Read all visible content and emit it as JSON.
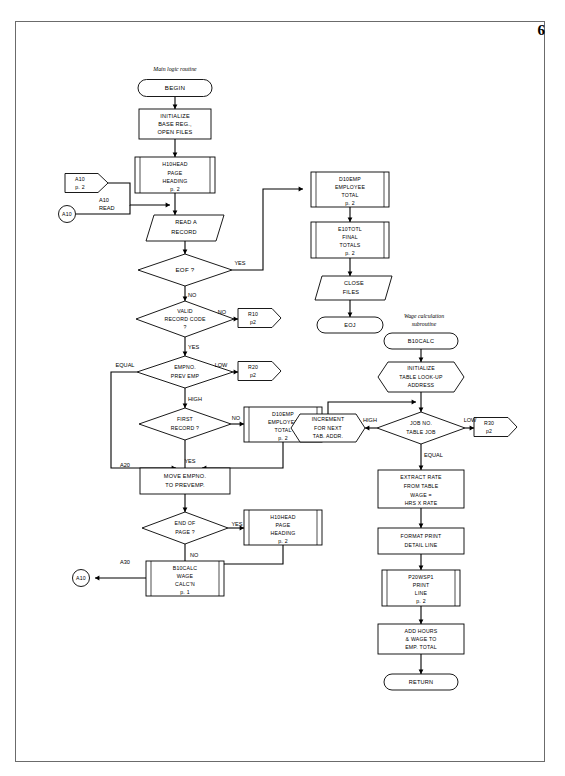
{
  "page": {
    "number": "6",
    "captions": {
      "main_routine": "Main logic routine",
      "wage_subroutine": "Wage calculation subroutine"
    }
  },
  "flowchart": {
    "title": "COBOL payroll program flowchart",
    "nodes": [
      {
        "id": "begin",
        "type": "terminator",
        "label": "BEGIN",
        "lines": [
          "BEGIN"
        ],
        "x": 175,
        "y": 88,
        "w": 74,
        "h": 17
      },
      {
        "id": "init",
        "type": "process",
        "label": "INITIALIZE BASE REG., OPEN FILES",
        "lines": [
          "INITIALIZE",
          "BASE REG.,",
          "OPEN FILES"
        ],
        "x": 175,
        "y": 124,
        "w": 72,
        "h": 30
      },
      {
        "id": "h10head1",
        "type": "predefined-process",
        "label": "H10HEAD PAGE HEADING p. 2",
        "lines": [
          "H10HEAD",
          "PAGE",
          "HEADING",
          "p. 2"
        ],
        "x": 175,
        "y": 175,
        "w": 80,
        "h": 36
      },
      {
        "id": "conn_a10_offpage",
        "type": "offpage-connector",
        "label": "A10 p. 2",
        "lines": [
          "A10",
          "p. 2"
        ],
        "x": 86,
        "y": 183,
        "w": 42,
        "h": 19
      },
      {
        "id": "conn_a10_circle",
        "type": "connector-circle",
        "label": "A10",
        "lines": [
          "A10"
        ],
        "x": 67,
        "y": 214,
        "w": 17,
        "h": 17
      },
      {
        "id": "read",
        "type": "input-output",
        "label": "READ A RECORD",
        "lines": [
          "READ A",
          "RECORD"
        ],
        "x": 185,
        "y": 228,
        "w": 78,
        "h": 26
      },
      {
        "id": "eof",
        "type": "decision",
        "label": "EOF ?",
        "lines": [
          "EOF ?"
        ],
        "x": 185,
        "y": 270,
        "w": 94,
        "h": 32
      },
      {
        "id": "validcode",
        "type": "decision",
        "label": "VALID RECORD CODE ?",
        "lines": [
          "VALID",
          "RECORD CODE",
          "?"
        ],
        "x": 185,
        "y": 319,
        "w": 98,
        "h": 36
      },
      {
        "id": "conn_r10",
        "type": "offpage-connector",
        "label": "R10 p2",
        "lines": [
          "R10",
          "p2"
        ],
        "x": 243,
        "y": 318,
        "w": 38,
        "h": 19
      },
      {
        "id": "empno",
        "type": "decision",
        "label": "EMPNO. PREV EMP",
        "lines": [
          "EMPNO.",
          "PREV EMP"
        ],
        "x": 185,
        "y": 372,
        "w": 96,
        "h": 32
      },
      {
        "id": "conn_r20",
        "type": "offpage-connector",
        "label": "R20 p2",
        "lines": [
          "R20",
          "p2"
        ],
        "x": 243,
        "y": 371,
        "w": 38,
        "h": 19
      },
      {
        "id": "firstrec",
        "type": "decision",
        "label": "FIRST RECORD ?",
        "lines": [
          "FIRST",
          "RECORD ?"
        ],
        "x": 185,
        "y": 424,
        "w": 92,
        "h": 32
      },
      {
        "id": "d10emp_a",
        "type": "predefined-process",
        "label": "D10EMP EMPLOYEE TOTAL p. 2",
        "lines": [
          "D10EMP",
          "EMPLOYEE",
          "TOTAL",
          "p. 2"
        ],
        "x": 283,
        "y": 424,
        "w": 78,
        "h": 35
      },
      {
        "id": "move",
        "type": "process",
        "label": "MOVE EMPNO. TO PREVEMP.",
        "lines": [
          "MOVE EMPNO.",
          "TO PREVEMP."
        ],
        "x": 185,
        "y": 481,
        "w": 90,
        "h": 26
      },
      {
        "id": "endpage",
        "type": "decision",
        "label": "END OF PAGE ?",
        "lines": [
          "END OF",
          "PAGE ?"
        ],
        "x": 185,
        "y": 528,
        "w": 86,
        "h": 32
      },
      {
        "id": "h10head2",
        "type": "predefined-process",
        "label": "H10HEAD PAGE HEADING p. 2",
        "lines": [
          "H10HEAD",
          "PAGE",
          "HEADING",
          "p. 2"
        ],
        "x": 283,
        "y": 527,
        "w": 78,
        "h": 35
      },
      {
        "id": "b10calc_call",
        "type": "predefined-process",
        "label": "B10CALC WAGE CALC'N p. 1",
        "lines": [
          "B10CALC",
          "WAGE",
          "CALC'N",
          "p. 1"
        ],
        "x": 185,
        "y": 578,
        "w": 78,
        "h": 35
      },
      {
        "id": "conn_a10_bottom",
        "type": "connector-circle",
        "label": "A10",
        "lines": [
          "A10"
        ],
        "x": 81,
        "y": 578,
        "w": 17,
        "h": 17
      },
      {
        "id": "d10emp_b",
        "type": "predefined-process",
        "label": "D10EMP EMPLOYEE TOTAL p. 2",
        "lines": [
          "D10EMP",
          "EMPLOYEE",
          "TOTAL",
          "p. 2"
        ],
        "x": 350,
        "y": 189,
        "w": 78,
        "h": 35
      },
      {
        "id": "e10totl",
        "type": "predefined-process",
        "label": "E10TOTL FINAL TOTALS p. 2",
        "lines": [
          "E10TOTL",
          "FINAL",
          "TOTALS",
          "p. 2"
        ],
        "x": 350,
        "y": 240,
        "w": 78,
        "h": 35
      },
      {
        "id": "closefiles",
        "type": "input-output",
        "label": "CLOSE FILES",
        "lines": [
          "CLOSE",
          "FILES"
        ],
        "x": 350,
        "y": 288,
        "w": 70,
        "h": 24
      },
      {
        "id": "eoj",
        "type": "terminator",
        "label": "EOJ",
        "lines": [
          "EOJ"
        ],
        "x": 350,
        "y": 325,
        "w": 66,
        "h": 16
      },
      {
        "id": "b10calc",
        "type": "terminator",
        "label": "B10CALC",
        "lines": [
          "B10CALC"
        ],
        "x": 421,
        "y": 341,
        "w": 74,
        "h": 16
      },
      {
        "id": "inittable",
        "type": "preparation",
        "label": "INITIALIZE TABLE LOOK-UP ADDRESS",
        "lines": [
          "INITIALIZE",
          "TABLE LOOK-UP",
          "ADDRESS"
        ],
        "x": 421,
        "y": 377,
        "w": 86,
        "h": 30
      },
      {
        "id": "jobno",
        "type": "decision",
        "label": "JOB NO. TABLE JOB",
        "lines": [
          "JOB NO.",
          "TABLE JOB"
        ],
        "x": 421,
        "y": 428,
        "w": 88,
        "h": 32
      },
      {
        "id": "increment",
        "type": "preparation",
        "label": "INCREMENT FOR NEXT TAB. ADDR.",
        "lines": [
          "INCREMENT",
          "FOR NEXT",
          "TAB. ADDR."
        ],
        "x": 328,
        "y": 428,
        "w": 74,
        "h": 28
      },
      {
        "id": "conn_r30",
        "type": "offpage-connector",
        "label": "R30 p2",
        "lines": [
          "R30",
          "p2"
        ],
        "x": 479,
        "y": 427,
        "w": 38,
        "h": 19
      },
      {
        "id": "extract",
        "type": "process",
        "label": "EXTRACT RATE FROM TABLE WAGE = HRS X RATE",
        "lines": [
          "EXTRACT RATE",
          "FROM TABLE",
          "WAGE =",
          "HRS X RATE"
        ],
        "x": 421,
        "y": 489,
        "w": 86,
        "h": 38
      },
      {
        "id": "format",
        "type": "process",
        "label": "FORMAT PRINT DETAIL LINE",
        "lines": [
          "FORMAT PRINT",
          "DETAIL LINE"
        ],
        "x": 421,
        "y": 541,
        "w": 86,
        "h": 26
      },
      {
        "id": "p20wsp1",
        "type": "predefined-process",
        "label": "P20WSP1 PRINT LINE p. 2",
        "lines": [
          "P20WSP1",
          "PRINT",
          "LINE",
          "p. 2"
        ],
        "x": 421,
        "y": 588,
        "w": 78,
        "h": 35
      },
      {
        "id": "addhours",
        "type": "process",
        "label": "ADD HOURS & WAGE TO EMP. TOTAL",
        "lines": [
          "ADD HOURS",
          "& WAGE TO",
          "EMP. TOTAL"
        ],
        "x": 421,
        "y": 639,
        "w": 86,
        "h": 30
      },
      {
        "id": "return",
        "type": "terminator",
        "label": "RETURN",
        "lines": [
          "RETURN"
        ],
        "x": 421,
        "y": 682,
        "w": 74,
        "h": 16
      }
    ],
    "edge_labels": [
      {
        "text": "A10",
        "x": 108,
        "y": 201
      },
      {
        "text": "READ",
        "x": 109,
        "y": 209
      },
      {
        "text": "YES",
        "x": 240,
        "y": 264
      },
      {
        "text": "NO",
        "x": 198,
        "y": 300
      },
      {
        "text": "NO",
        "x": 216,
        "y": 313
      },
      {
        "text": "YES",
        "x": 198,
        "y": 350
      },
      {
        "text": "EQUAL",
        "x": 125,
        "y": 366
      },
      {
        "text": "LOW",
        "x": 215,
        "y": 366
      },
      {
        "text": "HIGH",
        "x": 199,
        "y": 403
      },
      {
        "text": "NO",
        "x": 250,
        "y": 420
      },
      {
        "text": "YES",
        "x": 200,
        "y": 461
      },
      {
        "text": "A20",
        "x": 125,
        "y": 470
      },
      {
        "text": "YES",
        "x": 247,
        "y": 528
      },
      {
        "text": "NO",
        "x": 201,
        "y": 558
      },
      {
        "text": "A30",
        "x": 125,
        "y": 567
      },
      {
        "text": "HIGH",
        "x": 383,
        "y": 423
      },
      {
        "text": "LOW",
        "x": 458,
        "y": 423
      },
      {
        "text": "EQUAL",
        "x": 440,
        "y": 461
      }
    ]
  }
}
